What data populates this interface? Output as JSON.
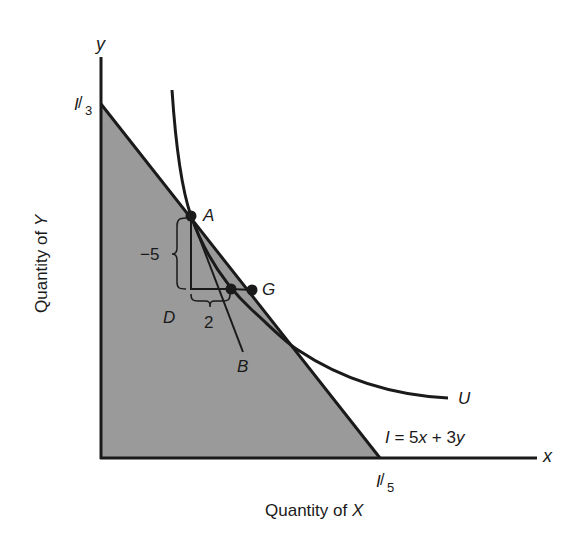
{
  "figure": {
    "type": "indifference curve and budget constraint",
    "axes": {
      "x_axis_symbol": "x",
      "y_axis_symbol": "y",
      "x_label_prefix": "Quantity of ",
      "x_label_var": "X",
      "y_label_prefix": "Quantity of ",
      "y_label_var": "Y"
    },
    "intercepts": {
      "y_intercept": {
        "num": "I",
        "den": "3"
      },
      "x_intercept": {
        "num": "I",
        "den": "5"
      }
    },
    "budget_line": {
      "equation": "I = 5x + 3y",
      "equation_parts": {
        "lhs": "I",
        "mid": " = 5",
        "x": "x",
        "plus": " + 3",
        "y": "y"
      }
    },
    "shaded_region_label": "D",
    "indifference_curve_label": "U",
    "points": [
      {
        "name": "A",
        "label": "A"
      },
      {
        "name": "B",
        "label": "B"
      },
      {
        "name": "G",
        "label": "G"
      }
    ],
    "annotations": {
      "vertical_change": "−5",
      "horizontal_change": "2"
    },
    "colors": {
      "shade": "#9a9a9a",
      "ink": "#1a1a1a",
      "background": "#ffffff"
    }
  }
}
